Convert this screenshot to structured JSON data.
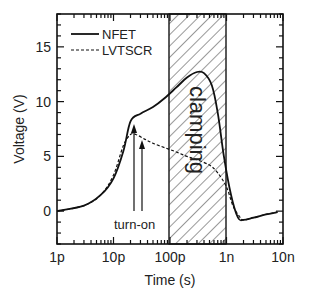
{
  "chart_data": {
    "type": "line",
    "title": "",
    "xlabel": "Time (s)",
    "ylabel": "Voltage (V)",
    "xscale": "log",
    "xlim": [
      1e-12,
      1e-08
    ],
    "ylim": [
      -3,
      18
    ],
    "x_tick_labels": [
      "1p",
      "10p",
      "100p",
      "1n",
      "10n"
    ],
    "x_tick_values": [
      1e-12,
      1e-11,
      1e-10,
      1e-09,
      1e-08
    ],
    "y_tick_labels": [
      "0",
      "5",
      "10",
      "15"
    ],
    "y_tick_values": [
      0,
      5,
      10,
      15
    ],
    "grid": false,
    "legend": {
      "position": "upper left",
      "entries": [
        "NFET",
        "LVTSCR"
      ]
    },
    "series": [
      {
        "name": "NFET",
        "style": "solid",
        "x": [
          1e-12,
          3e-12,
          6e-12,
          1e-11,
          1.5e-11,
          2e-11,
          3e-11,
          5e-11,
          8e-11,
          1.3e-10,
          2e-10,
          3e-10,
          4e-10,
          5.5e-10,
          7e-10,
          9e-10,
          1.2e-09,
          1.6e-09,
          2e-09,
          3e-09,
          5e-09,
          8e-09
        ],
        "values": [
          0.0,
          0.5,
          1.5,
          3.0,
          5.5,
          8.2,
          8.9,
          9.5,
          10.3,
          11.3,
          12.2,
          12.7,
          12.6,
          11.5,
          9.0,
          5.0,
          1.5,
          -0.6,
          -0.8,
          -0.6,
          -0.3,
          -0.1
        ]
      },
      {
        "name": "LVTSCR",
        "style": "dashed",
        "x": [
          1e-12,
          3e-12,
          6e-12,
          1e-11,
          1.5e-11,
          2e-11,
          2.5e-11,
          3.5e-11,
          5e-11,
          8e-11,
          1.3e-10,
          2e-10,
          3e-10,
          5e-10,
          7e-10,
          1e-09,
          1.3e-09,
          1.7e-09,
          2e-09,
          3e-09,
          5e-09,
          8e-09
        ],
        "values": [
          0.0,
          0.5,
          1.5,
          3.3,
          6.0,
          7.0,
          7.0,
          6.6,
          6.2,
          5.8,
          5.4,
          5.0,
          4.7,
          4.2,
          3.5,
          2.2,
          0.5,
          -0.5,
          -0.8,
          -0.6,
          -0.3,
          -0.1
        ]
      }
    ],
    "annotations": [
      {
        "text": "turn-on",
        "type": "arrows",
        "arrow_x": [
          2.1e-11,
          2.9e-11
        ],
        "arrow_tip_y": [
          7.8,
          6.3
        ]
      },
      {
        "text": "clamping",
        "type": "hatched_region",
        "x_range": [
          1e-10,
          1e-09
        ],
        "text_rotation": 90
      }
    ]
  },
  "labels": {
    "ylabel": "Voltage (V)",
    "xlabel": "Time (s)",
    "legend_nfet": "NFET",
    "legend_lvtscr": "LVTSCR",
    "turn_on": "turn-on",
    "clamping": "clamping",
    "x_ticks": [
      "1p",
      "10p",
      "100p",
      "1n",
      "10n"
    ],
    "y_ticks": [
      "0",
      "5",
      "10",
      "15"
    ]
  }
}
